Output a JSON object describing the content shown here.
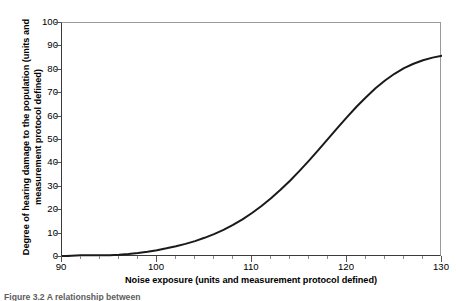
{
  "figure": {
    "caption": "Figure 3.2  A relationship between"
  },
  "chart_data": {
    "type": "line",
    "title": "",
    "xlabel": "Noise exposure (units and measurement protocol defined)",
    "ylabel_line1": "Degree of hearing damage to the population (units and",
    "ylabel_line2": "measurement protocol defined)",
    "ylabel": "Degree of hearing damage to the population (units and measurement protocol defined)",
    "xlim": [
      90,
      130
    ],
    "ylim": [
      0,
      100
    ],
    "grid": false,
    "legend": "none",
    "x_major_ticks": [
      90,
      100,
      110,
      120,
      130
    ],
    "x_major_tick_labels": [
      "90",
      "100",
      "110",
      "120",
      "130"
    ],
    "x_minor_tick_step": 2,
    "y_ticks": [
      0,
      10,
      20,
      30,
      40,
      50,
      60,
      70,
      80,
      90,
      100
    ],
    "y_tick_labels": [
      "0",
      "10",
      "20",
      "30",
      "40",
      "50",
      "60",
      "70",
      "80",
      "90",
      "100"
    ],
    "series": [
      {
        "name": "Hearing damage dose-response",
        "color": "#1a1a1a",
        "line_width": 2,
        "x": [
          90,
          91,
          92,
          93,
          94,
          95,
          96,
          97,
          98,
          99,
          100,
          101,
          102,
          103,
          104,
          105,
          106,
          107,
          108,
          109,
          110,
          111,
          112,
          113,
          114,
          115,
          116,
          117,
          118,
          119,
          120,
          121,
          122,
          123,
          124,
          125,
          126,
          127,
          128,
          129,
          130
        ],
        "values": [
          0.3,
          0.5,
          0.7,
          0.7,
          0.7,
          0.8,
          1.0,
          1.3,
          1.7,
          2.2,
          2.9,
          3.7,
          4.6,
          5.6,
          6.8,
          8.2,
          9.8,
          11.6,
          13.7,
          16.1,
          18.8,
          21.8,
          25.1,
          28.7,
          32.6,
          36.8,
          41.2,
          45.8,
          50.5,
          55.2,
          59.8,
          64.2,
          68.3,
          72.1,
          75.4,
          78.3,
          80.7,
          82.6,
          84.1,
          85.2,
          86.0
        ]
      }
    ]
  }
}
